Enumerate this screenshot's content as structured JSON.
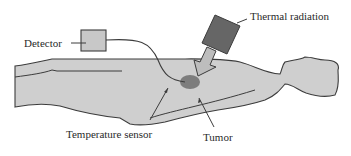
{
  "figure": {
    "type": "schematic",
    "colors": {
      "body_fill": "#cfcfcf",
      "outline": "#3c3c3c",
      "detector_fill": "#c8c8c8",
      "thermal_source_fill": "#666666",
      "radiation_arrow_fill": "#bdbdbd",
      "tumor_fill": "#7d7d7d",
      "text": "#2a2a2a"
    }
  },
  "labels": {
    "detector": "Detector",
    "thermal_radiation": "Thermal radiation",
    "temperature_sensor": "Temperature sensor",
    "tumor": "Tumor"
  }
}
